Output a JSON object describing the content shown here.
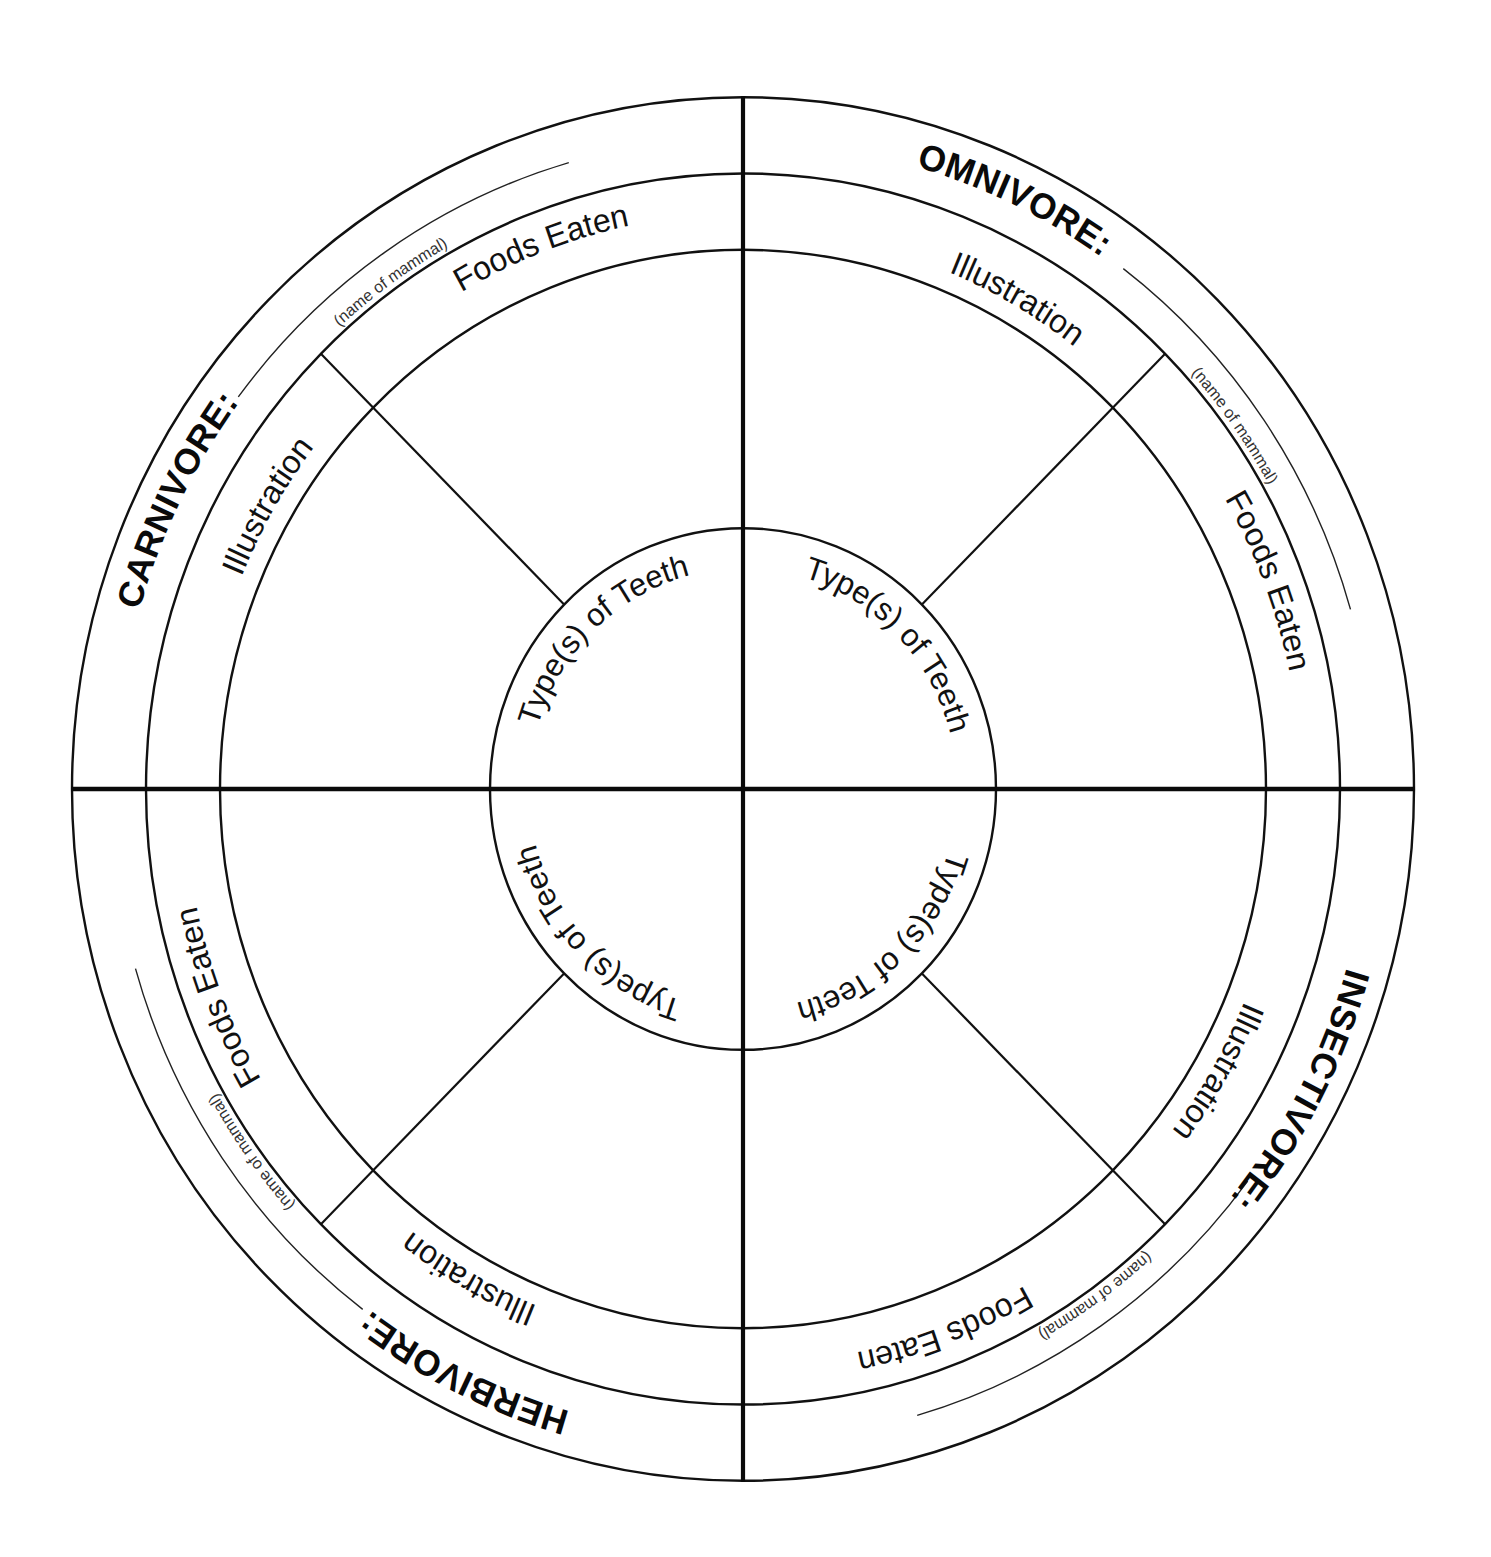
{
  "diagram": {
    "colors": {
      "ink": "#111111",
      "background": "#ffffff"
    },
    "quadrants": [
      {
        "position": "top-left",
        "category": "CARNIVORE:",
        "name_hint": "(name of mammal)",
        "illustration_label": "Illustration",
        "foods_label": "Foods Eaten",
        "teeth_label": "Type(s) of Teeth"
      },
      {
        "position": "top-right",
        "category": "OMNIVORE:",
        "name_hint": "(name of mammal)",
        "illustration_label": "Illustration",
        "foods_label": "Foods Eaten",
        "teeth_label": "Type(s) of Teeth"
      },
      {
        "position": "bottom-right",
        "category": "INSECTIVORE:",
        "name_hint": "(name of mammal)",
        "illustration_label": "Illustration",
        "foods_label": "Foods Eaten",
        "teeth_label": "Type(s) of Teeth"
      },
      {
        "position": "bottom-left",
        "category": "HERBIVORE:",
        "name_hint": "(name of mammal)",
        "illustration_label": "Illustration",
        "foods_label": "Foods Eaten",
        "teeth_label": "Type(s) of Teeth"
      }
    ]
  }
}
